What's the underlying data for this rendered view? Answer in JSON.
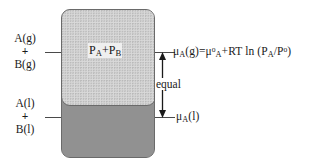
{
  "diagram": {
    "colors": {
      "gas_fill": "#d9d9d9",
      "liquid_fill": "#919191",
      "vessel_border": "#6a6a6a",
      "text": "#1a1a1a",
      "leader_line": "#4a4a4a"
    },
    "left_labels": {
      "gas": {
        "top": "A(g)",
        "plus": "+",
        "bottom": "B(g)"
      },
      "liquid": {
        "top": "A(l)",
        "plus": "+",
        "bottom": "B(l)"
      }
    },
    "vessel": {
      "gas_region_label_parts": {
        "p_a": "P",
        "sub_a": "A",
        "plus": "+",
        "p_b": "P",
        "sub_b": "B"
      },
      "gas_region_label_text": "PA+PB"
    },
    "right_labels": {
      "gas_equation_parts": {
        "mu": "μ",
        "sub_a1": "A",
        "phase_g": "(g)=",
        "mu2": "μ",
        "sup_standard": "o",
        "sub_a2": "A",
        "rt_ln": "+RT ln (",
        "p1": "P",
        "sub_a3": "A",
        "slash": "/P",
        "sup_standard2": "o",
        "close": ")"
      },
      "gas_equation_text": "μA(g)=μoA+RT ln (PA/Po)",
      "liquid_parts": {
        "mu": "μ",
        "sub_a": "A",
        "phase_l": "(l)"
      },
      "liquid_text": "μA(l)"
    },
    "annotation": {
      "equal_label": "equal",
      "arrow_type": "double-headed-vertical"
    }
  }
}
